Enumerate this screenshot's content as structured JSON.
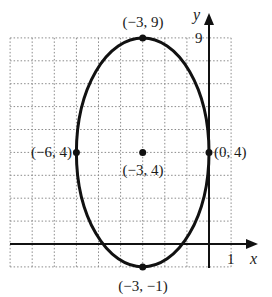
{
  "chart_data": {
    "type": "scatter",
    "title": "",
    "subtitle": "",
    "shape": "ellipse",
    "xlabel": "x",
    "ylabel": "y",
    "xlim": [
      -9,
      1
    ],
    "ylim": [
      -1,
      9
    ],
    "grid": true,
    "x_tick_labels": [
      {
        "value": 1,
        "label": "1"
      }
    ],
    "y_tick_labels": [
      {
        "value": 9,
        "label": "9"
      }
    ],
    "ellipse": {
      "center": [
        -3,
        4
      ],
      "semi_axis_x": 3,
      "semi_axis_y": 5
    },
    "points": [
      {
        "x": -3,
        "y": 9,
        "label": "(−3, 9)"
      },
      {
        "x": -6,
        "y": 4,
        "label": "(−6, 4)"
      },
      {
        "x": -3,
        "y": 4,
        "label": "(−3, 4)"
      },
      {
        "x": 0,
        "y": 4,
        "label": "(0, 4)"
      },
      {
        "x": -3,
        "y": -1,
        "label": "(−3, −1)"
      }
    ],
    "legend": null
  },
  "colors": {
    "curve": "#111111",
    "axes": "#111111",
    "grid": "#8a8a8a",
    "background": "#ffffff"
  }
}
